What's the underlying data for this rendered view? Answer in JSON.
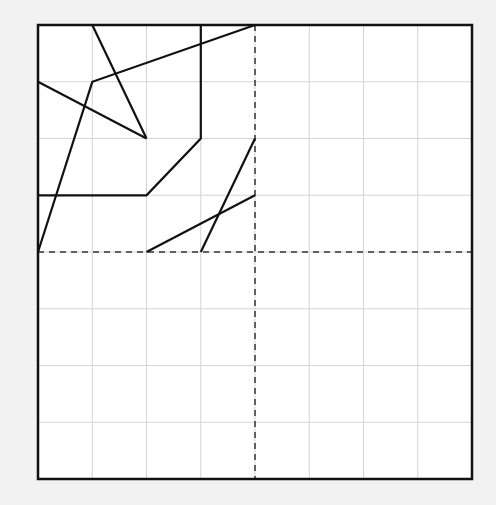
{
  "figure": {
    "type": "grid-diagram",
    "grid": {
      "cols": 8,
      "rows": 8
    },
    "colors": {
      "background": "#f2f2f2",
      "panel": "#ffffff",
      "grid_line": "#d4d4d4",
      "stroke": "#111111",
      "dashed": "#333333"
    },
    "axes_dashed": {
      "vertical_col": 4,
      "horizontal_row": 4
    },
    "segments": [
      {
        "id": "line-a",
        "points": [
          [
            1,
            0
          ],
          [
            2,
            2
          ]
        ]
      },
      {
        "id": "line-b",
        "points": [
          [
            0,
            1
          ],
          [
            2,
            2
          ]
        ]
      },
      {
        "id": "polyline-c",
        "points": [
          [
            0,
            4
          ],
          [
            1,
            1
          ],
          [
            4,
            0
          ]
        ]
      },
      {
        "id": "polyline-d",
        "points": [
          [
            3,
            0
          ],
          [
            3,
            2
          ],
          [
            2,
            3
          ],
          [
            0,
            3
          ]
        ]
      },
      {
        "id": "line-e",
        "points": [
          [
            4,
            2
          ],
          [
            3,
            4
          ]
        ]
      },
      {
        "id": "line-f",
        "points": [
          [
            2,
            4
          ],
          [
            4,
            3
          ]
        ]
      }
    ]
  }
}
